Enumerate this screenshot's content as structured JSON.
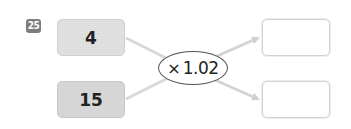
{
  "problem": {
    "number": "25",
    "inputs": [
      {
        "value": "4"
      },
      {
        "value": "15"
      }
    ],
    "operator": {
      "symbol": "×",
      "operand": "1.02"
    },
    "outputs": [
      {
        "value": ""
      },
      {
        "value": ""
      }
    ]
  },
  "colors": {
    "badge": "#7d7d7d",
    "input_box": "#dcdcdc",
    "arrow": "#d4d4d4",
    "output_border": "#d2d2d2"
  }
}
